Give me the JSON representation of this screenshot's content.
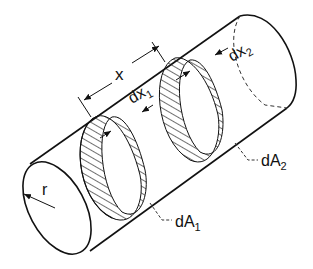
{
  "diagram": {
    "type": "cylinder-view-factor",
    "labels": {
      "x": "x",
      "dx1": "dx",
      "dx1_sub": "1",
      "dx2": "dx",
      "dx2_sub": "2",
      "r": "r",
      "dA1": "dA",
      "dA1_sub": "1",
      "dA2": "dA",
      "dA2_sub": "2"
    },
    "colors": {
      "stroke": "#111111",
      "background": "#ffffff"
    }
  }
}
